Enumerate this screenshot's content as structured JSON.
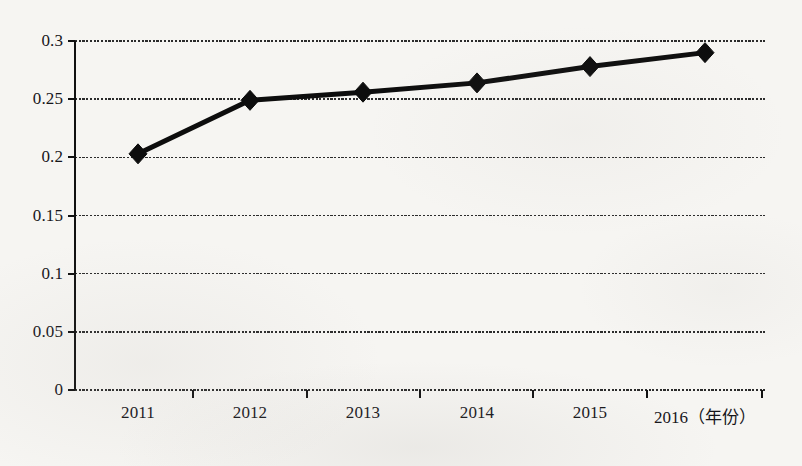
{
  "chart_data": {
    "type": "line",
    "title": "",
    "subtitle": "",
    "xlabel": "年份",
    "ylabel": "",
    "categories": [
      "2011",
      "2012",
      "2013",
      "2014",
      "2015",
      "2016"
    ],
    "x_tick_labels": [
      "2011",
      "2012",
      "2013",
      "2014",
      "2015",
      "2016（年份）"
    ],
    "y_tick_labels": [
      "0",
      "0.05",
      "0.1",
      "0.15",
      "0.2",
      "0.25",
      "0.3"
    ],
    "y_ticks": [
      0,
      0.05,
      0.1,
      0.15,
      0.2,
      0.25,
      0.3
    ],
    "ylim": [
      0,
      0.3
    ],
    "grid": "horizontal",
    "legend": "none",
    "series": [
      {
        "name": "series-1",
        "values": [
          0.203,
          0.249,
          0.256,
          0.264,
          0.278,
          0.29
        ],
        "color": "#0d0d0d",
        "marker": "diamond",
        "line_width": 5
      }
    ]
  },
  "style": {
    "background_color": "#f6f5f2",
    "axis_color": "#111111",
    "gridline_color": "#2b2b2b",
    "text_color": "#16161a",
    "series_color": "#0d0d0d"
  },
  "geometry": {
    "plot_left": 75,
    "plot_right": 767,
    "plot_top": 41,
    "plot_bottom": 390,
    "category_centers": [
      138,
      250,
      363,
      477,
      590,
      705
    ],
    "category_boundaries": [
      80,
      193,
      307,
      420,
      533,
      647,
      762
    ]
  }
}
